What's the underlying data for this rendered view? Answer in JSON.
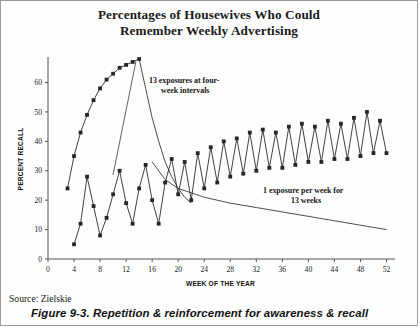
{
  "title_line1": "Percentages of Housewives Who Could",
  "title_line2": "Remember Weekly Advertising",
  "source": "Source: Zielskie",
  "caption": "Figure 9-3. Repetition & reinforcement for awareness & recall",
  "annotations": {
    "a1_line1": "13 exposures at four-",
    "a1_line2": "week intervals",
    "a2_line1": "1 exposure per week for",
    "a2_line2": "13 weeks"
  },
  "chart_data": {
    "type": "line",
    "title": "Percentages of Housewives Who Could Remember Weekly Advertising",
    "xlabel": "WEEK OF THE YEAR",
    "ylabel": "PERCENT RECALL",
    "xlim": [
      0,
      53
    ],
    "ylim": [
      0,
      68
    ],
    "xticks": [
      0,
      4,
      8,
      12,
      16,
      20,
      24,
      28,
      32,
      36,
      40,
      44,
      48,
      52
    ],
    "yticks": [
      0,
      10,
      20,
      30,
      40,
      50,
      60
    ],
    "grid": false,
    "legend": "none",
    "marker": "square",
    "series": [
      {
        "name": "13 exposures at four-week intervals",
        "annotation": "13 exposures at four-week intervals",
        "markers": true,
        "x": [
          3,
          4,
          5,
          6,
          7,
          8,
          9,
          10,
          11,
          12,
          13,
          14
        ],
        "y": [
          24,
          35,
          43,
          49,
          54,
          58,
          61,
          63,
          65,
          66,
          67,
          68
        ]
      },
      {
        "name": "decay after 13 exposures",
        "markers": false,
        "x": [
          14,
          15,
          16,
          17,
          18,
          19,
          20,
          21,
          22
        ],
        "y": [
          68,
          58,
          48,
          40,
          33,
          28,
          24,
          21,
          19
        ]
      },
      {
        "name": "1 exposure per week for 13 weeks",
        "annotation": "1 exposure per week for 13 weeks",
        "markers": true,
        "x": [
          4,
          5,
          6,
          7,
          8,
          9,
          10,
          11,
          12,
          13,
          14,
          15,
          16,
          17,
          18,
          19,
          20,
          21,
          22,
          23,
          24,
          25,
          26,
          27,
          28,
          29,
          30,
          31,
          32,
          33,
          34,
          35,
          36,
          37,
          38,
          39,
          40,
          41,
          42,
          43,
          44,
          45,
          46,
          47,
          48,
          49,
          50,
          51,
          52
        ],
        "y": [
          5,
          12,
          28,
          18,
          8,
          14,
          22,
          30,
          19,
          12,
          24,
          32,
          20,
          12,
          26,
          34,
          22,
          33,
          20,
          36,
          24,
          38,
          26,
          40,
          28,
          41,
          29,
          43,
          30,
          44,
          31,
          43,
          31,
          45,
          32,
          46,
          33,
          45,
          33,
          47,
          34,
          46,
          34,
          48,
          35,
          50,
          36,
          47,
          36
        ]
      },
      {
        "name": "weekly-exposure decay curve",
        "markers": false,
        "x": [
          16,
          18,
          20,
          24,
          28,
          32,
          36,
          40,
          44,
          48,
          52
        ],
        "y": [
          33,
          27,
          24,
          21,
          19,
          17.5,
          16,
          14.5,
          13,
          11.5,
          10
        ]
      }
    ]
  }
}
